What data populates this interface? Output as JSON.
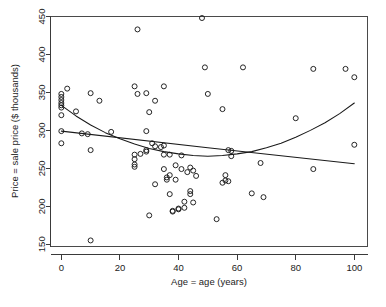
{
  "chart_data": {
    "type": "scatter",
    "title": "",
    "subtitle": "",
    "xlabel": "Age = age (years)",
    "ylabel": "Price = sale price ($ thousands)",
    "xlim": [
      -3.7,
      104.5
    ],
    "ylim": [
      147,
      450
    ],
    "xticks": [
      0,
      20,
      40,
      60,
      80,
      100
    ],
    "xticklabels": [
      "0",
      "20",
      "40",
      "60",
      "80",
      "100"
    ],
    "yticks": [
      150,
      200,
      250,
      300,
      350,
      400,
      450
    ],
    "yticklabels": [
      "150",
      "200",
      "250",
      "300",
      "350",
      "400",
      "450"
    ],
    "grid": false,
    "legend": null,
    "marker": "open-circle",
    "point_color": "#1a1a1a",
    "line_color": "#1a1a1a",
    "background": "#ffffff",
    "n_points": 85,
    "points": [
      {
        "x": 0,
        "y": 348
      },
      {
        "x": 0,
        "y": 344
      },
      {
        "x": 0,
        "y": 340
      },
      {
        "x": 0,
        "y": 336
      },
      {
        "x": 0,
        "y": 333
      },
      {
        "x": 0,
        "y": 330
      },
      {
        "x": 0,
        "y": 320
      },
      {
        "x": 0,
        "y": 299
      },
      {
        "x": 0,
        "y": 283
      },
      {
        "x": 2,
        "y": 355
      },
      {
        "x": 5,
        "y": 325
      },
      {
        "x": 7,
        "y": 296
      },
      {
        "x": 9,
        "y": 295
      },
      {
        "x": 10,
        "y": 349
      },
      {
        "x": 10,
        "y": 274
      },
      {
        "x": 10,
        "y": 155
      },
      {
        "x": 13,
        "y": 339
      },
      {
        "x": 17,
        "y": 298
      },
      {
        "x": 25,
        "y": 358
      },
      {
        "x": 25,
        "y": 268
      },
      {
        "x": 25,
        "y": 262
      },
      {
        "x": 25,
        "y": 255
      },
      {
        "x": 25,
        "y": 252
      },
      {
        "x": 26,
        "y": 433
      },
      {
        "x": 26,
        "y": 348
      },
      {
        "x": 27,
        "y": 269
      },
      {
        "x": 29,
        "y": 349
      },
      {
        "x": 29,
        "y": 299
      },
      {
        "x": 29,
        "y": 274
      },
      {
        "x": 29,
        "y": 272
      },
      {
        "x": 30,
        "y": 324
      },
      {
        "x": 30,
        "y": 188
      },
      {
        "x": 31,
        "y": 283
      },
      {
        "x": 32,
        "y": 339
      },
      {
        "x": 32,
        "y": 279
      },
      {
        "x": 32,
        "y": 229
      },
      {
        "x": 34,
        "y": 278
      },
      {
        "x": 35,
        "y": 358
      },
      {
        "x": 35,
        "y": 280
      },
      {
        "x": 35,
        "y": 268
      },
      {
        "x": 35,
        "y": 249
      },
      {
        "x": 36,
        "y": 238
      },
      {
        "x": 36,
        "y": 235
      },
      {
        "x": 37,
        "y": 268
      },
      {
        "x": 37,
        "y": 241
      },
      {
        "x": 37,
        "y": 216
      },
      {
        "x": 38,
        "y": 193
      },
      {
        "x": 38,
        "y": 194
      },
      {
        "x": 39,
        "y": 254
      },
      {
        "x": 39,
        "y": 235
      },
      {
        "x": 40,
        "y": 197
      },
      {
        "x": 40,
        "y": 196
      },
      {
        "x": 41,
        "y": 267
      },
      {
        "x": 41,
        "y": 249
      },
      {
        "x": 42,
        "y": 206
      },
      {
        "x": 42,
        "y": 198
      },
      {
        "x": 43,
        "y": 245
      },
      {
        "x": 44,
        "y": 251
      },
      {
        "x": 44,
        "y": 220
      },
      {
        "x": 44,
        "y": 216
      },
      {
        "x": 45,
        "y": 247
      },
      {
        "x": 45,
        "y": 205
      },
      {
        "x": 46,
        "y": 240
      },
      {
        "x": 48,
        "y": 448
      },
      {
        "x": 49,
        "y": 383
      },
      {
        "x": 50,
        "y": 348
      },
      {
        "x": 53,
        "y": 183
      },
      {
        "x": 55,
        "y": 328
      },
      {
        "x": 55,
        "y": 231
      },
      {
        "x": 56,
        "y": 241
      },
      {
        "x": 56,
        "y": 234
      },
      {
        "x": 57,
        "y": 233
      },
      {
        "x": 57,
        "y": 274
      },
      {
        "x": 58,
        "y": 273
      },
      {
        "x": 58,
        "y": 266
      },
      {
        "x": 62,
        "y": 383
      },
      {
        "x": 65,
        "y": 217
      },
      {
        "x": 68,
        "y": 257
      },
      {
        "x": 69,
        "y": 212
      },
      {
        "x": 80,
        "y": 316
      },
      {
        "x": 86,
        "y": 381
      },
      {
        "x": 86,
        "y": 249
      },
      {
        "x": 97,
        "y": 381
      },
      {
        "x": 100,
        "y": 370
      },
      {
        "x": 100,
        "y": 281
      }
    ],
    "fits": [
      {
        "name": "quadratic-fit",
        "description": "U-shaped quadratic fit, high at age 0, minimum near age 50, rising at high age",
        "points": [
          {
            "x": 0,
            "y": 333
          },
          {
            "x": 5,
            "y": 319
          },
          {
            "x": 10,
            "y": 307
          },
          {
            "x": 15,
            "y": 297
          },
          {
            "x": 20,
            "y": 289
          },
          {
            "x": 25,
            "y": 282
          },
          {
            "x": 30,
            "y": 276
          },
          {
            "x": 35,
            "y": 272
          },
          {
            "x": 40,
            "y": 269
          },
          {
            "x": 45,
            "y": 267
          },
          {
            "x": 50,
            "y": 266
          },
          {
            "x": 55,
            "y": 267
          },
          {
            "x": 60,
            "y": 269
          },
          {
            "x": 65,
            "y": 272
          },
          {
            "x": 70,
            "y": 277
          },
          {
            "x": 75,
            "y": 283
          },
          {
            "x": 80,
            "y": 291
          },
          {
            "x": 85,
            "y": 300
          },
          {
            "x": 90,
            "y": 310
          },
          {
            "x": 95,
            "y": 322
          },
          {
            "x": 100,
            "y": 336
          }
        ]
      },
      {
        "name": "linear-fit",
        "description": "Nearly flat linear fit, slowly declining from about 299 to 256",
        "points": [
          {
            "x": 0,
            "y": 299
          },
          {
            "x": 50,
            "y": 277
          },
          {
            "x": 100,
            "y": 256
          }
        ]
      }
    ]
  },
  "figure": {
    "x_axis_name": "Age = age (years)",
    "y_axis_name": "Price = sale price ($ thousands)"
  }
}
